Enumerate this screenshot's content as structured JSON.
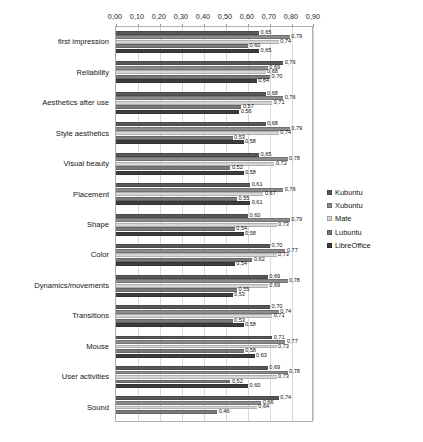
{
  "chart_data": {
    "type": "bar",
    "orientation": "horizontal",
    "title": "",
    "xlabel": "",
    "ylabel": "",
    "xlim": [
      0.0,
      0.9
    ],
    "grid": true,
    "legend_position": "right",
    "tick_labels": [
      "0,00",
      "0,10",
      "0,20",
      "0,30",
      "0,40",
      "0,50",
      "0,60",
      "0,70",
      "0,80",
      "0,90"
    ],
    "tick_values": [
      0.0,
      0.1,
      0.2,
      0.3,
      0.4,
      0.5,
      0.6,
      0.7,
      0.8,
      0.9
    ],
    "categories": [
      "first impression",
      "Reliability",
      "Aesthetics after use",
      "Style aesthetics",
      "Visual beauty",
      "Placement",
      "Shape",
      "Color",
      "Dynamics/movements",
      "Transitions",
      "Mouse",
      "User activities",
      "Sound"
    ],
    "series": [
      {
        "name": "Kubuntu",
        "color": "#595959",
        "values": [
          0.65,
          0.76,
          0.68,
          0.68,
          0.65,
          0.61,
          0.6,
          0.7,
          0.69,
          0.7,
          0.71,
          0.69,
          0.74
        ],
        "labels": [
          "0,65",
          "0,76",
          "0,68",
          "0,68",
          "0,65",
          "0,61",
          "0,60",
          "0,70",
          "0,69",
          "0,70",
          "0,71",
          "0,69",
          "0,74"
        ]
      },
      {
        "name": "Xubuntu",
        "color": "#8c8c8c",
        "values": [
          0.79,
          0.69,
          0.76,
          0.79,
          0.78,
          0.76,
          0.79,
          0.77,
          0.78,
          0.74,
          0.77,
          0.78,
          0.66
        ],
        "labels": [
          "0,79",
          "0,69",
          "0,76",
          "0,79",
          "0,78",
          "0,76",
          "0,79",
          "0,77",
          "0,78",
          "0,74",
          "0,77",
          "0,78",
          "0,66"
        ]
      },
      {
        "name": "Mate",
        "color": "#d6d6d6",
        "values": [
          0.74,
          0.68,
          0.71,
          0.74,
          0.72,
          0.67,
          0.73,
          0.73,
          0.69,
          0.71,
          0.73,
          0.73,
          0.64
        ],
        "labels": [
          "0,74",
          "0,68",
          "0,71",
          "0,74",
          "0,72",
          "0,67",
          "0,73",
          "0,73",
          "0,69",
          "0,71",
          "0,73",
          "0,73",
          "0,64"
        ]
      },
      {
        "name": "Lubuntu",
        "color": "#7a7a7a",
        "values": [
          0.6,
          0.7,
          0.57,
          0.53,
          0.52,
          0.55,
          0.54,
          0.62,
          0.55,
          0.53,
          0.58,
          0.52,
          0.46
        ],
        "labels": [
          "0,60",
          "0,70",
          "0,57",
          "0,53",
          "0,52",
          "0,55",
          "0,54",
          "0,62",
          "0,55",
          "0,53",
          "0,58",
          "0,52",
          "0,46"
        ]
      },
      {
        "name": "LibreOffice",
        "color": "#3d3d3d",
        "values": [
          0.65,
          0.64,
          0.56,
          0.58,
          0.58,
          0.61,
          0.58,
          0.54,
          0.53,
          0.58,
          0.63,
          0.6,
          0.0
        ],
        "labels": [
          "0,65",
          "0,64",
          "0,56",
          "0,58",
          "0,58",
          "0,61",
          "0,58",
          "0,54",
          "0,53",
          "0,58",
          "0,63",
          "0,60",
          ""
        ]
      }
    ]
  }
}
